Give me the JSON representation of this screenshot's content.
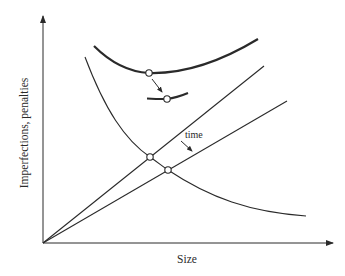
{
  "diagram": {
    "type": "conceptual-tradeoff-plot",
    "x_axis_label": "Size",
    "y_axis_label": "Imperfections, penalties",
    "annotation_time": "time",
    "colors": {
      "ink": "#2a2a2a",
      "background": "#ffffff"
    },
    "curves": [
      {
        "name": "total-cost-curve",
        "style": "thick",
        "shape": "U-shaped, minimum marked"
      },
      {
        "name": "shifted-total-cost-minimum",
        "style": "thick",
        "shape": "short segment, minimum marked"
      },
      {
        "name": "imperfections-curve",
        "style": "thin",
        "shape": "decreasing hyperbola"
      },
      {
        "name": "penalty-line-initial",
        "style": "thin",
        "shape": "straight line from origin, steeper"
      },
      {
        "name": "penalty-line-later",
        "style": "thin",
        "shape": "straight line from origin, shallower"
      }
    ],
    "markers": [
      {
        "name": "optimum-initial",
        "shape": "open-circle"
      },
      {
        "name": "optimum-shifted",
        "shape": "open-circle"
      },
      {
        "name": "intersection-initial",
        "shape": "open-circle"
      },
      {
        "name": "intersection-later",
        "shape": "open-circle"
      }
    ],
    "arrows": [
      {
        "name": "optimum-shift-arrow",
        "meaning": "minimum moves with time"
      },
      {
        "name": "time-arrow",
        "meaning": "penalty line rotates down over time"
      }
    ]
  }
}
